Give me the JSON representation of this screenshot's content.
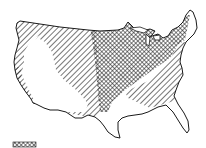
{
  "map": {
    "subject": "contiguous-united-states",
    "regions": [
      {
        "id": "west",
        "fill": "none"
      },
      {
        "id": "plains-and-southeast",
        "fill": "diagonal-hatch"
      },
      {
        "id": "midwest",
        "fill": "crosshatch"
      }
    ],
    "colors": {
      "ink": "#1a1a1a",
      "background": "#ffffff"
    }
  },
  "legend": {
    "swatch": "crosshatch"
  }
}
